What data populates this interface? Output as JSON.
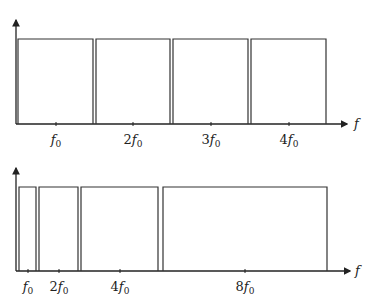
{
  "top_plot": {
    "axis_label": "f",
    "bands": [
      {
        "x0": 18,
        "x1": 93
      },
      {
        "x0": 96,
        "x1": 170
      },
      {
        "x0": 173,
        "x1": 248
      },
      {
        "x0": 251,
        "x1": 326
      }
    ],
    "ticks": [
      {
        "x": 56,
        "coef": "",
        "var": "f",
        "sub": "0"
      },
      {
        "x": 133,
        "coef": "2",
        "var": "f",
        "sub": "0"
      },
      {
        "x": 211,
        "coef": "3",
        "var": "f",
        "sub": "0"
      },
      {
        "x": 289,
        "coef": "4",
        "var": "f",
        "sub": "0"
      }
    ]
  },
  "bottom_plot": {
    "axis_label": "f",
    "bands": [
      {
        "x0": 19,
        "x1": 36
      },
      {
        "x0": 39,
        "x1": 78
      },
      {
        "x0": 81,
        "x1": 158
      },
      {
        "x0": 163,
        "x1": 327
      }
    ],
    "ticks": [
      {
        "x": 28,
        "coef": "",
        "var": "f",
        "sub": "0"
      },
      {
        "x": 59,
        "coef": "2",
        "var": "f",
        "sub": "0"
      },
      {
        "x": 120,
        "coef": "4",
        "var": "f",
        "sub": "0"
      },
      {
        "x": 245,
        "coef": "8",
        "var": "f",
        "sub": "0"
      }
    ]
  }
}
